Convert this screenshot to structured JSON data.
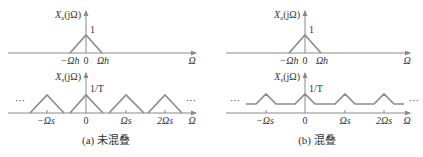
{
  "panels": [
    {
      "id": "a",
      "caption": "(a) 未混叠",
      "top_plot": {
        "ylabel": "Xa(jΩ)",
        "ylabel_main": "X",
        "ylabel_sub": "a",
        "ylabel_arg": "(jΩ)",
        "peak_label": "1",
        "xlabel": "Ω",
        "ticks": [
          "−Ωh",
          "0",
          "Ωh"
        ]
      },
      "bottom_plot": {
        "ylabel": "Xs(jΩ)",
        "ylabel_main": "X",
        "ylabel_sub": "s",
        "ylabel_arg": "(jΩ)",
        "peak_label": "1/T",
        "xlabel": "Ω",
        "ticks": [
          "−Ωs",
          "0",
          "Ωs",
          "2Ωs"
        ],
        "ellipsis_left": "···",
        "ellipsis_right": "···"
      }
    },
    {
      "id": "b",
      "caption": "(b) 混叠",
      "top_plot": {
        "ylabel": "Xa(jΩ)",
        "ylabel_main": "X",
        "ylabel_sub": "a",
        "ylabel_arg": "(jΩ)",
        "peak_label": "1",
        "xlabel": "Ω",
        "ticks": [
          "−Ωh",
          "0",
          "Ωh"
        ]
      },
      "bottom_plot": {
        "ylabel": "Xs(jΩ)",
        "ylabel_main": "X",
        "ylabel_sub": "s",
        "ylabel_arg": "(jΩ)",
        "peak_label": "1/T",
        "xlabel": "Ω",
        "ticks": [
          "−Ωs",
          "0",
          "Ωs",
          "2Ωs"
        ],
        "ellipsis_left": "···",
        "ellipsis_right": "···"
      }
    }
  ],
  "colors": {
    "line": "#8a8a8a",
    "text": "#333333"
  }
}
